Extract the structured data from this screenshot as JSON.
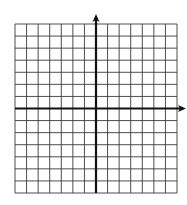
{
  "diagram": {
    "type": "coordinate-grid",
    "grid": {
      "left": 15,
      "top": 24,
      "right": 177,
      "bottom": 193,
      "columns": 14,
      "rows": 14,
      "line_color": "#3a3a3a",
      "line_width": 0.9
    },
    "axes": {
      "color": "#111111",
      "width": 2.2,
      "origin_col": 7,
      "origin_row": 7,
      "y_axis_top": 14,
      "x_axis_right": 186,
      "y_arrow": true,
      "x_arrow": true
    },
    "background": "#ffffff"
  }
}
